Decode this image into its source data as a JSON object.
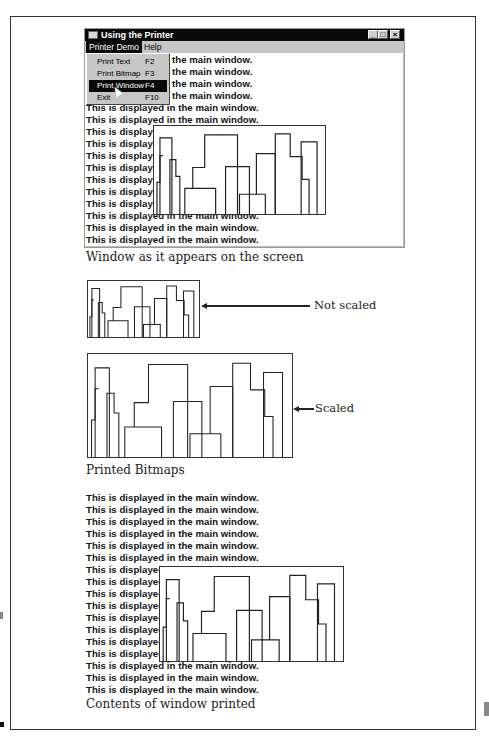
{
  "window": {
    "title": "Using the Printer",
    "controls": [
      "minimize",
      "maximize",
      "close"
    ],
    "menu": [
      {
        "label": "Printer Demo",
        "active": true
      },
      {
        "label": "Help",
        "active": false
      }
    ],
    "dropdown": [
      {
        "label": "Print Text",
        "shortcut": "F2",
        "selected": false
      },
      {
        "label": "Print Bitmap",
        "shortcut": "F3",
        "selected": false
      },
      {
        "label": "Print Window",
        "shortcut": "F4",
        "selected": true
      },
      {
        "label": "Exit",
        "shortcut": "F10",
        "selected": false
      }
    ],
    "lines_full": "This is displayed in the main window.",
    "lines_right": "the main window.",
    "lines_clipped": "This is displaye",
    "lines_partial": "This is displayed in the main window."
  },
  "captions": {
    "screen": "Window as it appears on the screen",
    "printed_bitmaps": "Printed Bitmaps",
    "contents_printed": "Contents of window printed"
  },
  "labels": {
    "not_scaled": "Not scaled",
    "scaled": "Scaled"
  },
  "printout": {
    "line": "This is displayed in the main window.",
    "clipped": "This is displaye"
  }
}
